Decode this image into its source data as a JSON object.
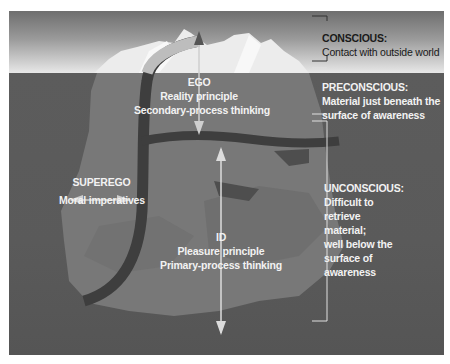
{
  "diagram": {
    "colors": {
      "sky_top": "#6e6e6e",
      "sky_bottom": "#e8e8e8",
      "water": "#5a5a5a",
      "iceberg": "#787878",
      "band": "#3e3e3e",
      "label_light": "#f2f2f2",
      "label_dark": "#1a1a1a"
    },
    "levels": [
      {
        "id": "conscious",
        "title": "CONSCIOUS:",
        "lines": [
          "Contact with outside world"
        ]
      },
      {
        "id": "preconscious",
        "title": "PRECONSCIOUS:",
        "lines": [
          "Material just beneath the",
          "surface of awareness"
        ]
      },
      {
        "id": "unconscious",
        "title": "UNCONSCIOUS:",
        "lines": [
          "Difficult to",
          "retrieve",
          "material;",
          "well below the",
          "surface of",
          "awareness"
        ]
      }
    ],
    "structures": {
      "ego": {
        "title": "EGO",
        "lines": [
          "Reality principle",
          "Secondary-process thinking"
        ]
      },
      "superego": {
        "title": "SUPEREGO",
        "lines": [
          "Moral imperatives"
        ]
      },
      "id": {
        "title": "ID",
        "lines": [
          "Pleasure principle",
          "Primary-process thinking"
        ]
      }
    },
    "icons": {
      "ego_arrow": "double-vertical-arrow",
      "id_arrow": "double-vertical-arrow",
      "superego_arrow": "double-horizontal-arrow",
      "level_brackets": "bracket"
    }
  }
}
